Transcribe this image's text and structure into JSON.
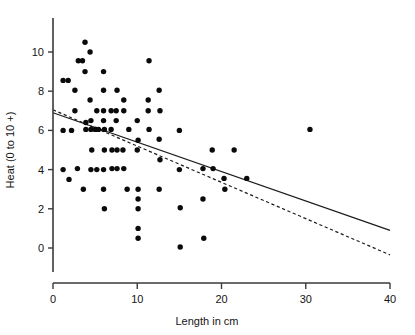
{
  "chart_data": {
    "type": "scatter",
    "title": "",
    "xlabel": "Length in cm",
    "ylabel": "Heat (0 to 10 +)",
    "xlim": [
      0,
      40
    ],
    "ylim": [
      -2.2,
      11.7
    ],
    "xticks": [
      0,
      10,
      20,
      30,
      40
    ],
    "xtick_labels": [
      "0",
      "10",
      "20",
      "30",
      "40"
    ],
    "yticks": [
      0,
      2,
      4,
      6,
      8,
      10
    ],
    "ytick_labels": [
      "0",
      "2",
      "4",
      "6",
      "8",
      "10"
    ],
    "grid": false,
    "legend": "none",
    "marker": "filled-circle",
    "points": [
      [
        1.2,
        8.55
      ],
      [
        1.8,
        8.55
      ],
      [
        1.2,
        6.0
      ],
      [
        2.2,
        6.0
      ],
      [
        1.2,
        4.0
      ],
      [
        1.9,
        3.5
      ],
      [
        2.6,
        8.05
      ],
      [
        2.6,
        7.0
      ],
      [
        3.0,
        9.55
      ],
      [
        3.5,
        9.55
      ],
      [
        2.9,
        4.05
      ],
      [
        3.8,
        10.5
      ],
      [
        3.8,
        9.0
      ],
      [
        3.9,
        6.4
      ],
      [
        3.9,
        6.05
      ],
      [
        3.6,
        3.0
      ],
      [
        4.4,
        10.0
      ],
      [
        4.4,
        7.55
      ],
      [
        4.5,
        6.5
      ],
      [
        4.5,
        6.05
      ],
      [
        4.6,
        5.0
      ],
      [
        4.5,
        4.0
      ],
      [
        5.2,
        7.0
      ],
      [
        5.1,
        6.05
      ],
      [
        5.0,
        6.05
      ],
      [
        5.4,
        6.05
      ],
      [
        5.2,
        4.0
      ],
      [
        6.0,
        9.0
      ],
      [
        6.0,
        8.05
      ],
      [
        6.0,
        7.0
      ],
      [
        6.0,
        6.5
      ],
      [
        6.1,
        6.05
      ],
      [
        6.1,
        5.0
      ],
      [
        6.0,
        4.0
      ],
      [
        6.0,
        3.0
      ],
      [
        6.1,
        2.0
      ],
      [
        6.9,
        7.0
      ],
      [
        6.9,
        6.05
      ],
      [
        7.0,
        5.0
      ],
      [
        7.0,
        4.05
      ],
      [
        7.6,
        8.05
      ],
      [
        7.5,
        7.0
      ],
      [
        7.5,
        6.5
      ],
      [
        7.6,
        5.0
      ],
      [
        7.6,
        4.05
      ],
      [
        8.4,
        7.55
      ],
      [
        8.4,
        7.0
      ],
      [
        8.3,
        5.0
      ],
      [
        8.4,
        4.05
      ],
      [
        8.8,
        3.0
      ],
      [
        9.0,
        6.05
      ],
      [
        10.0,
        6.5
      ],
      [
        10.1,
        5.5
      ],
      [
        10.0,
        5.0
      ],
      [
        10.1,
        3.0
      ],
      [
        10.1,
        2.5
      ],
      [
        10.1,
        2.0
      ],
      [
        10.1,
        1.0
      ],
      [
        10.1,
        0.5
      ],
      [
        11.4,
        9.55
      ],
      [
        11.3,
        7.55
      ],
      [
        11.3,
        7.0
      ],
      [
        11.4,
        6.05
      ],
      [
        12.6,
        8.05
      ],
      [
        12.7,
        7.0
      ],
      [
        12.6,
        5.55
      ],
      [
        12.7,
        4.5
      ],
      [
        12.6,
        3.0
      ],
      [
        15.0,
        6.0
      ],
      [
        15.0,
        4.0
      ],
      [
        15.1,
        2.05
      ],
      [
        15.1,
        0.05
      ],
      [
        17.8,
        4.05
      ],
      [
        17.8,
        2.5
      ],
      [
        17.9,
        0.5
      ],
      [
        18.9,
        5.0
      ],
      [
        19.0,
        4.05
      ],
      [
        20.3,
        3.55
      ],
      [
        20.4,
        3.0
      ],
      [
        21.5,
        5.0
      ],
      [
        23.0,
        3.55
      ],
      [
        30.5,
        6.05
      ]
    ],
    "fit_lines": [
      {
        "name": "solid-regression",
        "style": "solid",
        "x": [
          0,
          40
        ],
        "y": [
          6.9,
          0.9
        ]
      },
      {
        "name": "dashed-regression",
        "style": "dashed",
        "x": [
          0,
          40
        ],
        "y": [
          7.05,
          -0.35
        ]
      }
    ]
  }
}
